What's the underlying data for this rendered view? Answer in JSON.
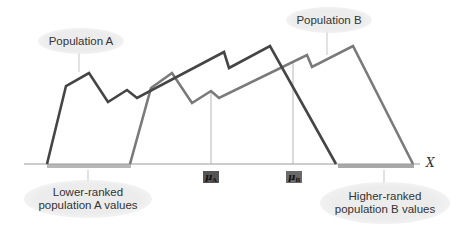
{
  "labels": {
    "population_a": "Population A",
    "population_b": "Population B",
    "lower_ranked": "Lower-ranked population A values",
    "lower_ranked_line1": "Lower-ranked",
    "lower_ranked_line2": "population A values",
    "higher_ranked_line1": "Higher-ranked",
    "higher_ranked_line2": "population B values",
    "mu_a_symbol": "μ",
    "mu_a_sub": "A",
    "mu_b_symbol": "μ",
    "mu_b_sub": "B",
    "x_axis": "X"
  },
  "colors": {
    "population_a_line": "#454545",
    "population_b_line": "#7a7a7a",
    "axis": "#9a9a9a",
    "mean_line": "#b5b5b5",
    "range_bar": "#b0b0b0",
    "bubble": "#ececec",
    "mu_box": "#555555"
  },
  "series": {
    "population_a": [
      [
        47,
        164
      ],
      [
        66,
        86
      ],
      [
        89,
        73
      ],
      [
        108,
        102
      ],
      [
        127,
        90
      ],
      [
        137,
        98
      ],
      [
        224,
        52
      ],
      [
        229,
        68
      ],
      [
        270,
        46
      ],
      [
        336,
        164
      ]
    ],
    "population_b": [
      [
        130,
        164
      ],
      [
        151,
        88
      ],
      [
        172,
        73
      ],
      [
        192,
        103
      ],
      [
        211,
        91
      ],
      [
        219,
        98
      ],
      [
        307,
        55
      ],
      [
        312,
        67
      ],
      [
        353,
        46
      ],
      [
        413,
        164
      ]
    ]
  },
  "markers": {
    "mu_a_x": 211,
    "mu_b_x": 293
  }
}
